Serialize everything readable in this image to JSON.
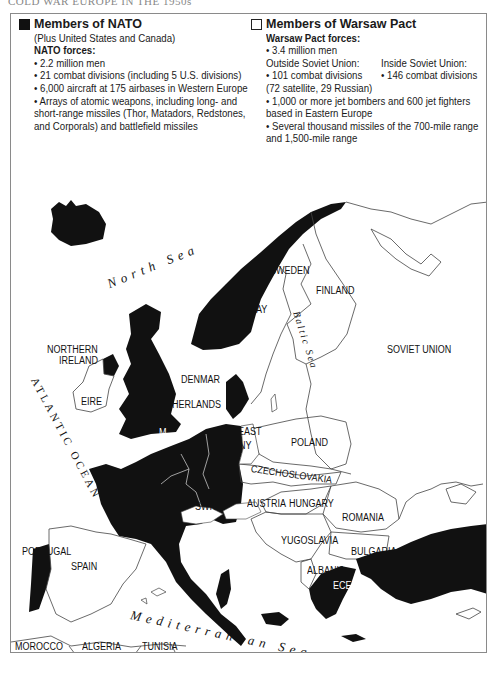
{
  "page_title": "COLD WAR EUROPE IN THE 1950s",
  "legend": {
    "nato": {
      "swatch_color": "#111111",
      "title": "Members of NATO",
      "subtitle": "(Plus United States and Canada)",
      "forces_heading": "NATO forces:",
      "items": [
        "• 2.2 million men",
        "• 21 combat divisions (including 5 U.S. divisions)",
        "• 6,000 aircraft at 175 airbases in Western Europe",
        "• Arrays of atomic weapons, including long- and",
        "short-range missiles (Thor, Matadors, Redstones,",
        "and Corporals) and battlefield missiles"
      ]
    },
    "warsaw": {
      "swatch_color": "#ffffff",
      "title": "Members of Warsaw Pact",
      "forces_heading": "Warsaw Pact forces:",
      "men": "• 3.4 million men",
      "outside_heading": "Outside Soviet Union:",
      "inside_heading": "Inside Soviet Union:",
      "outside_divisions": "• 101 combat divisions",
      "inside_divisions": "• 146 combat divisions",
      "outside_breakdown": "(72 satellite, 29 Russian)",
      "items": [
        "• 1,000 or more jet bombers and 600 jet fighters",
        "based in Eastern Europe",
        "• Several thousand missiles of the 700-mile range",
        "and 1,500-mile range"
      ]
    }
  },
  "seas": {
    "north_sea": "North Sea",
    "baltic_sea": "Baltic Sea",
    "atlantic": "ATLANTIC OCEAN",
    "mediterranean": "Mediterranean Sea",
    "black_sea": "Black Sea"
  },
  "countries": {
    "sweden": "SWEDEN",
    "norway_partial": "AY",
    "finland": "FINLAND",
    "soviet_union": "SOVIET UNION",
    "northern_ireland_1": "NORTHERN",
    "northern_ireland_2": "IRELAND",
    "eire": "EIRE",
    "denmark": "DENMAR",
    "netherlands": "NETHERLANDS",
    "uk_partial": "M",
    "east_germany_1": "EAST",
    "east_germany_2": "ANY",
    "poland": "POLAND",
    "czechoslovakia": "CZECHOSLOVAKIA",
    "switzerland": "SWITZ.",
    "austria": "AUSTRIA",
    "hungary": "HUNGARY",
    "romania": "ROMANIA",
    "yugoslavia": "YUGOSLAVIA",
    "bulgaria": "BULGARIA",
    "albania": "ALBANIA",
    "greece_partial": "ECE",
    "portugal": "PORTUGAL",
    "spain": "SPAIN",
    "morocco": "MOROCCO",
    "algeria": "ALGERIA",
    "tunisia": "TUNISIA"
  }
}
